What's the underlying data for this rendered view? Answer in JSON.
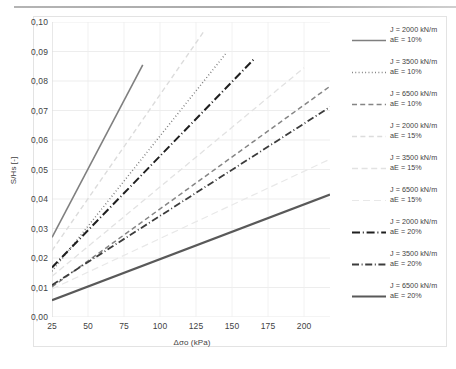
{
  "chart_data": {
    "type": "line",
    "title": "",
    "xlabel": "Δσo (kPa)",
    "ylabel": "S/Hs [-]",
    "xlim": [
      25,
      218
    ],
    "ylim": [
      0.0,
      0.1
    ],
    "grid": true,
    "legend_position": "right",
    "xticks": [
      "25",
      "50",
      "75",
      "100",
      "125",
      "150",
      "175",
      "200"
    ],
    "xtick_values": [
      25,
      50,
      75,
      100,
      125,
      150,
      175,
      200
    ],
    "yticks": [
      "0,00",
      "0,01",
      "0,02",
      "0,03",
      "0,04",
      "0,05",
      "0,06",
      "0,07",
      "0,08",
      "0,09",
      "0,10"
    ],
    "ytick_values": [
      0.0,
      0.01,
      0.02,
      0.03,
      0.04,
      0.05,
      0.06,
      0.07,
      0.08,
      0.09,
      0.1
    ],
    "series": [
      {
        "name": "J = 2000 kN/m aE = 10%",
        "label_line1": "J = 2000 kN/m",
        "label_line2": "aE = 10%",
        "J": 2000,
        "aE": "10%",
        "style": "solid",
        "color": "#7f7f7f",
        "width": 1.6,
        "x": [
          25,
          88
        ],
        "y": [
          0.027,
          0.0855
        ]
      },
      {
        "name": "J = 3500 kN/m aE = 10%",
        "label_line1": "J = 3500 kN/m",
        "label_line2": "aE = 10%",
        "J": 3500,
        "aE": "10%",
        "style": "dotted",
        "color": "#7a7a7a",
        "width": 1.5,
        "x": [
          25,
          146
        ],
        "y": [
          0.0155,
          0.0895
        ]
      },
      {
        "name": "J = 6500 kN/m aE = 10%",
        "label_line1": "J = 6500 kN/m",
        "label_line2": "aE = 10%",
        "J": 6500,
        "aE": "10%",
        "style": "dashed",
        "color": "#858585",
        "width": 1.5,
        "x": [
          25,
          218
        ],
        "y": [
          0.0102,
          0.0782
        ]
      },
      {
        "name": "J = 2000 kN/m aE = 15%",
        "label_line1": "J = 2000 kN/m",
        "label_line2": "aE = 15%",
        "J": 2000,
        "aE": "15%",
        "style": "dashed-light",
        "color": "#dcdcdc",
        "width": 1.4,
        "x": [
          25,
          130
        ],
        "y": [
          0.0225,
          0.0965
        ]
      },
      {
        "name": "J = 3500 kN/m aE = 15%",
        "label_line1": "J = 3500 kN/m",
        "label_line2": "aE = 15%",
        "J": 3500,
        "aE": "15%",
        "style": "dashed-light2",
        "color": "#e2e2e2",
        "width": 1.3,
        "x": [
          25,
          200
        ],
        "y": [
          0.0138,
          0.0845
        ]
      },
      {
        "name": "J = 6500 kN/m aE = 15%",
        "label_line1": "J = 6500 kN/m",
        "label_line2": "aE = 15%",
        "J": 6500,
        "aE": "15%",
        "style": "dashed-light3",
        "color": "#e8e8e8",
        "width": 1.2,
        "x": [
          25,
          218
        ],
        "y": [
          0.0095,
          0.0535
        ]
      },
      {
        "name": "J = 2000 kN/m aE = 20%",
        "label_line1": "J = 2000 kN/m",
        "label_line2": "aE = 20%",
        "J": 2000,
        "aE": "20%",
        "style": "dashdot-bold",
        "color": "#1f1f1f",
        "width": 2.0,
        "x": [
          25,
          166
        ],
        "y": [
          0.0168,
          0.0878
        ]
      },
      {
        "name": "J = 3500 kN/m aE = 20%",
        "label_line1": "J = 3500 kN/m",
        "label_line2": "aE = 20%",
        "J": 3500,
        "aE": "20%",
        "style": "dashdot",
        "color": "#3c3c3c",
        "width": 1.8,
        "x": [
          25,
          218
        ],
        "y": [
          0.0108,
          0.0712
        ]
      },
      {
        "name": "J = 6500 kN/m aE = 20%",
        "label_line1": "J = 6500 kN/m",
        "label_line2": "aE = 20%",
        "J": 6500,
        "aE": "20%",
        "style": "solid-bold",
        "color": "#595959",
        "width": 2.1,
        "x": [
          25,
          218
        ],
        "y": [
          0.0057,
          0.0415
        ]
      }
    ]
  }
}
